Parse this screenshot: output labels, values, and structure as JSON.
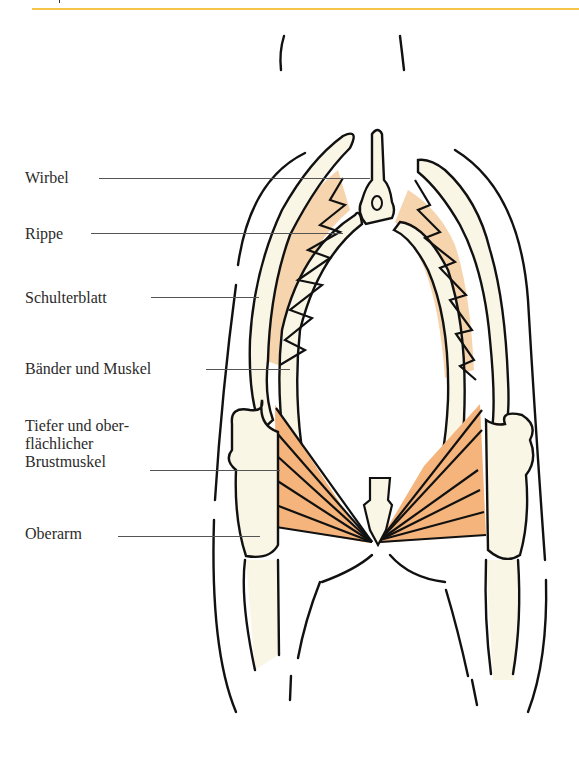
{
  "figure": {
    "labels": [
      {
        "text": "Wirbel"
      },
      {
        "text": "Rippe"
      },
      {
        "text": "Schulterblatt"
      },
      {
        "text": "Bänder und Muskel"
      },
      {
        "text": "Tiefer und ober-"
      },
      {
        "text": "flächlicher"
      },
      {
        "text": "Brustmuskel"
      },
      {
        "text": "Oberarm"
      }
    ],
    "colors": {
      "rule": "#f5c54a",
      "bone": "#faf6e6",
      "ligament": "#f6d4ad",
      "muscle": "#f4b47c",
      "outline": "#111111"
    }
  }
}
